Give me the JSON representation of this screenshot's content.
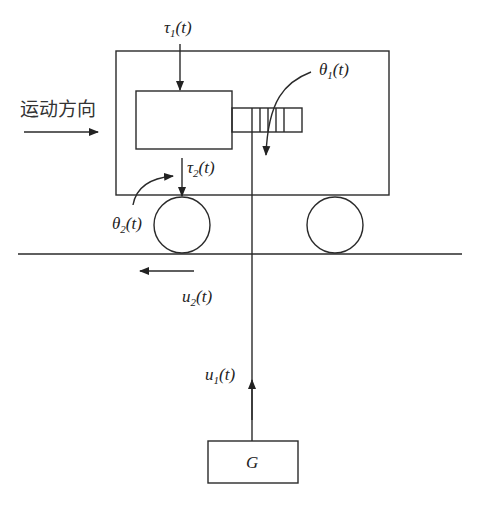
{
  "diagram": {
    "direction_label": "运动方向",
    "labels": {
      "tau1": {
        "sym": "τ",
        "sub": "1",
        "arg": "(t)"
      },
      "tau2": {
        "sym": "τ",
        "sub": "2",
        "arg": "(t)"
      },
      "theta1": {
        "sym": "θ",
        "sub": "1",
        "arg": "(t)"
      },
      "theta2": {
        "sym": "θ",
        "sub": "2",
        "arg": "(t)"
      },
      "u1": {
        "sym": "u",
        "sub": "1",
        "arg": "(t)"
      },
      "u2": {
        "sym": "u",
        "sub": "2",
        "arg": "(t)"
      },
      "mass": "G"
    },
    "colors": {
      "stroke": "#2a2a2a",
      "background": "#ffffff"
    }
  }
}
